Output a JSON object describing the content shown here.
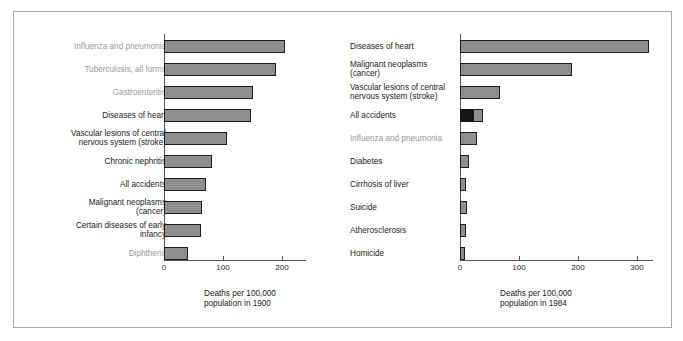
{
  "chart_data": {
    "type": "bar",
    "title": "",
    "orientation": "horizontal",
    "panels": [
      {
        "id": "left",
        "xlabel": "Deaths per 100,000\npopulation in 1900",
        "xlim": [
          0,
          240
        ],
        "ticks": [
          0,
          100,
          200
        ],
        "ticklabels": [
          "0",
          "100",
          "200"
        ],
        "grid": false,
        "categories": [
          "Influenza and pneumonia",
          "Tuberculosis, all forms",
          "Gastroenteritis",
          "Diseases of heart",
          "Vascular lesions of central\nnervous system (stroke)",
          "Chronic nephritis",
          "All accidents",
          "Malignant neoplasms\n(cancer)",
          "Certain diseases of early\ninfancy",
          "Diphtheria"
        ],
        "values": [
          205,
          190,
          151,
          148,
          107,
          81,
          72,
          64,
          62,
          40
        ],
        "dimmed": [
          true,
          true,
          true,
          false,
          false,
          false,
          false,
          false,
          false,
          true
        ]
      },
      {
        "id": "right",
        "xlabel": "Deaths per 100,000\npopulation in 1984",
        "xlim": [
          0,
          350
        ],
        "ticks": [
          0,
          100,
          200,
          300
        ],
        "ticklabels": [
          "0",
          "100",
          "200",
          "300"
        ],
        "grid": false,
        "categories": [
          "Diseases of heart",
          "Malignant neoplasms\n(cancer)",
          "Vascular lesions of central\nnervous system (stroke)",
          "All accidents",
          "Influenza and pneumonia",
          "Diabetes",
          "Cirrhosis of liver",
          "Suicide",
          "Atherosclerosis",
          "Homicide"
        ],
        "values": [
          320,
          190,
          68,
          39,
          28,
          16,
          11,
          12,
          10,
          9
        ],
        "segments": [
          null,
          null,
          null,
          [
            22,
            17
          ],
          null,
          null,
          null,
          null,
          null,
          null
        ],
        "dimmed": [
          false,
          false,
          false,
          false,
          true,
          false,
          false,
          false,
          false,
          false
        ]
      }
    ],
    "colors": {
      "bar_fill": "#8f8f8f",
      "bar_dark_fill": "#151515",
      "bar_border": "#1d1d1d",
      "axis": "#555555",
      "label": "#1a1a1a",
      "label_dim": "#9a9a9a",
      "frame_border": "#a8a8a8",
      "background": "#ffffff"
    }
  }
}
